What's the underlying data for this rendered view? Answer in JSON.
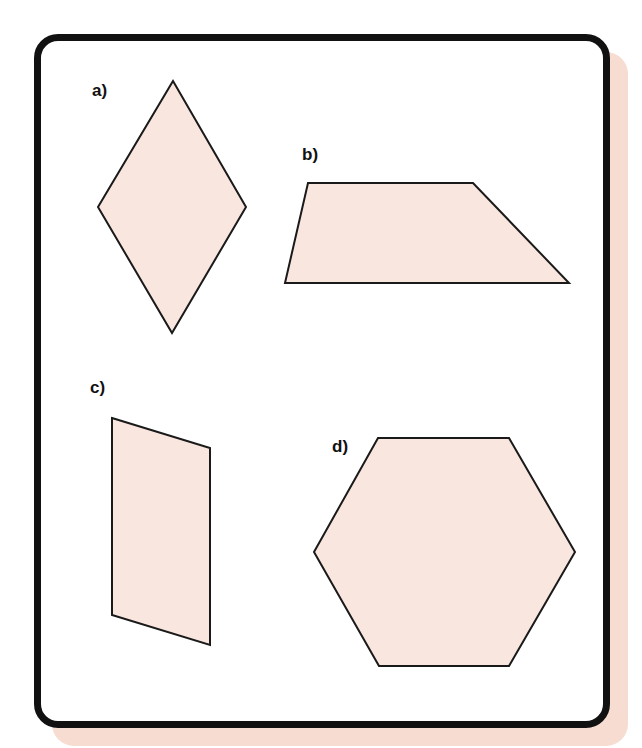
{
  "figure": {
    "frame": {
      "border_color": "#111111",
      "background": "#ffffff",
      "shadow_color": "#f6dcd1"
    },
    "shape_fill": "#f9e6df",
    "shape_stroke": "#1a1a1a",
    "shapes": [
      {
        "id": "a",
        "label": "a)",
        "kind": "rhombus",
        "label_pos": [
          92,
          96
        ],
        "points": [
          [
            173,
            81
          ],
          [
            246,
            207
          ],
          [
            172,
            333
          ],
          [
            98,
            207
          ]
        ]
      },
      {
        "id": "b",
        "label": "b)",
        "kind": "trapezoid",
        "label_pos": [
          302,
          160
        ],
        "points": [
          [
            308,
            183
          ],
          [
            473,
            183
          ],
          [
            569,
            283
          ],
          [
            285,
            283
          ]
        ]
      },
      {
        "id": "c",
        "label": "c)",
        "kind": "parallelogram",
        "label_pos": [
          90,
          393
        ],
        "points": [
          [
            112,
            418
          ],
          [
            210,
            448
          ],
          [
            210,
            645
          ],
          [
            112,
            615
          ]
        ]
      },
      {
        "id": "d",
        "label": "d)",
        "kind": "hexagon",
        "label_pos": [
          332,
          452
        ],
        "points": [
          [
            378,
            438
          ],
          [
            509,
            438
          ],
          [
            575,
            552
          ],
          [
            509,
            666
          ],
          [
            379,
            666
          ],
          [
            314,
            552
          ]
        ]
      }
    ]
  }
}
